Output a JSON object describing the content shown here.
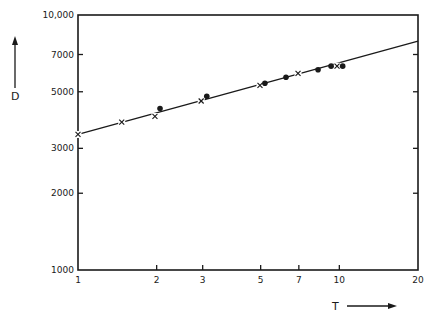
{
  "chart_data": {
    "type": "scatter",
    "title": "",
    "xlabel": "T",
    "ylabel": "D",
    "xscale": "log",
    "yscale": "log",
    "xlim": [
      1,
      20
    ],
    "ylim": [
      1000,
      10000
    ],
    "grid": false,
    "legend": null,
    "x_ticks": [
      {
        "value": 1,
        "label": "1"
      },
      {
        "value": 2,
        "label": "2"
      },
      {
        "value": 3,
        "label": "3"
      },
      {
        "value": 5,
        "label": "5"
      },
      {
        "value": 7,
        "label": "7"
      },
      {
        "value": 10,
        "label": "10"
      },
      {
        "value": 20,
        "label": "20"
      }
    ],
    "y_ticks": [
      {
        "value": 1000,
        "label": "1000"
      },
      {
        "value": 2000,
        "label": "2000"
      },
      {
        "value": 3000,
        "label": "3000"
      },
      {
        "value": 5000,
        "label": "5000"
      },
      {
        "value": 7000,
        "label": "7000"
      },
      {
        "value": 10000,
        "label": "10,000"
      }
    ],
    "series": [
      {
        "name": "cross markers",
        "marker": "x",
        "points": [
          {
            "x": 1.0,
            "y": 3400
          },
          {
            "x": 1.47,
            "y": 3800
          },
          {
            "x": 1.97,
            "y": 4000
          },
          {
            "x": 2.96,
            "y": 4600
          },
          {
            "x": 4.97,
            "y": 5300
          },
          {
            "x": 6.95,
            "y": 5900
          },
          {
            "x": 9.8,
            "y": 6300
          }
        ]
      },
      {
        "name": "dot markers",
        "marker": "dot",
        "points": [
          {
            "x": 2.06,
            "y": 4300
          },
          {
            "x": 3.11,
            "y": 4800
          },
          {
            "x": 5.19,
            "y": 5400
          },
          {
            "x": 6.25,
            "y": 5700
          },
          {
            "x": 8.29,
            "y": 6100
          },
          {
            "x": 9.3,
            "y": 6300
          },
          {
            "x": 10.3,
            "y": 6300
          }
        ]
      }
    ],
    "fit_line": {
      "x": [
        1,
        20
      ],
      "y": [
        3400,
        7900
      ]
    },
    "arrows": {
      "y_axis": "up",
      "x_axis": "right"
    }
  }
}
